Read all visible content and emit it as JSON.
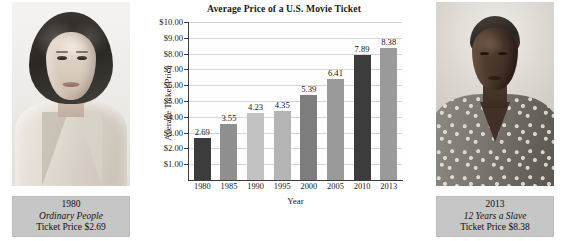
{
  "chart_data": {
    "type": "bar",
    "title": "Average Price of a U.S. Movie Ticket",
    "xlabel": "Year",
    "ylabel": "Average Ticket Price",
    "categories": [
      "1980",
      "1985",
      "1990",
      "1995",
      "2000",
      "2005",
      "2010",
      "2013"
    ],
    "values": [
      2.69,
      3.55,
      4.23,
      4.35,
      5.39,
      6.41,
      7.89,
      8.38
    ],
    "value_labels": [
      "2.69",
      "3.55",
      "4.23",
      "4.35",
      "5.39",
      "6.41",
      "7.89",
      "8.38"
    ],
    "bar_colors": [
      "#3c3c3c",
      "#8f8f8f",
      "#c2c2c2",
      "#b4b4b4",
      "#7d7d7d",
      "#9a9a9a",
      "#3c3c3c",
      "#9a9a9a"
    ],
    "ylim": [
      0,
      10
    ],
    "ytick_values": [
      1,
      2,
      3,
      4,
      5,
      6,
      7,
      8,
      9,
      10
    ],
    "ytick_labels": [
      "$1.00",
      "$2.00",
      "$3.00",
      "$4.00",
      "$5.00",
      "$6.00",
      "$7.00",
      "$8.00",
      "$9.00",
      "$10.00"
    ],
    "grid": true,
    "legend": "none"
  },
  "left_photo": {
    "caption_year": "1980",
    "caption_film": "Ordinary People",
    "caption_price": "Ticket Price $2.69"
  },
  "right_photo": {
    "caption_year": "2013",
    "caption_film": "12 Years a Slave",
    "caption_price": "Ticket Price $8.38"
  }
}
